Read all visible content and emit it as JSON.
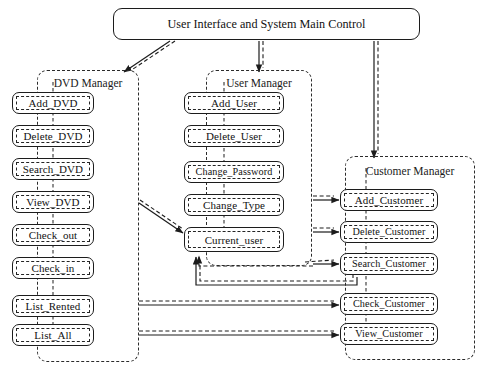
{
  "diagram": {
    "title": "User Interface and System Main Control",
    "root": {
      "label": "User Interface and System Main Control",
      "x": 113,
      "y": 8,
      "w": 307,
      "h": 32
    },
    "packages": [
      {
        "id": "dvd-manager",
        "label": "DVD Manager",
        "x": 37,
        "y": 70,
        "w": 102,
        "h": 292,
        "title_top": 6,
        "nodes": [
          {
            "id": "add-dvd",
            "label": "Add_DVD",
            "x": 12,
            "y": 92,
            "w": 82,
            "h": 22
          },
          {
            "id": "delete-dvd",
            "label": "Delete_DVD",
            "x": 12,
            "y": 125,
            "w": 82,
            "h": 22
          },
          {
            "id": "search-dvd",
            "label": "Search_DVD",
            "x": 12,
            "y": 158,
            "w": 82,
            "h": 22
          },
          {
            "id": "view-dvd",
            "label": "View_DVD",
            "x": 12,
            "y": 191,
            "w": 82,
            "h": 22
          },
          {
            "id": "check-out",
            "label": "Check_out",
            "x": 12,
            "y": 224,
            "w": 82,
            "h": 22
          },
          {
            "id": "check-in",
            "label": "Check_in",
            "x": 12,
            "y": 257,
            "w": 82,
            "h": 22
          },
          {
            "id": "list-rented",
            "label": "List_Rented",
            "x": 12,
            "y": 295,
            "w": 82,
            "h": 22
          },
          {
            "id": "list-all",
            "label": "List_All",
            "x": 12,
            "y": 324,
            "w": 82,
            "h": 22
          }
        ]
      },
      {
        "id": "user-manager",
        "label": "User Manager",
        "x": 206,
        "y": 70,
        "w": 106,
        "h": 196,
        "title_top": 6,
        "nodes": [
          {
            "id": "add-user",
            "label": "Add_User",
            "x": 184,
            "y": 92,
            "w": 100,
            "h": 22
          },
          {
            "id": "delete-user",
            "label": "Delete_User",
            "x": 184,
            "y": 125,
            "w": 100,
            "h": 22
          },
          {
            "id": "change-password",
            "label": "Change_Password",
            "x": 184,
            "y": 161,
            "w": 100,
            "h": 22,
            "tight": true
          },
          {
            "id": "change-type",
            "label": "Change_Type",
            "x": 184,
            "y": 194,
            "w": 100,
            "h": 22
          },
          {
            "id": "current-user",
            "label": "Current_user",
            "x": 184,
            "y": 227,
            "w": 100,
            "h": 25
          }
        ]
      },
      {
        "id": "customer-manager",
        "label": "Customer Manager",
        "x": 345,
        "y": 156,
        "w": 130,
        "h": 204,
        "title_top": 8,
        "nodes": [
          {
            "id": "add-customer",
            "label": "Add_Customer",
            "x": 340,
            "y": 189,
            "w": 98,
            "h": 22
          },
          {
            "id": "delete-customer",
            "label": "Delete_Customer",
            "x": 340,
            "y": 221,
            "w": 98,
            "h": 22,
            "tight": true
          },
          {
            "id": "search-customer",
            "label": "Search_Customer",
            "x": 340,
            "y": 253,
            "w": 98,
            "h": 22,
            "tight": true
          },
          {
            "id": "check-customer",
            "label": "Check_Customer",
            "x": 340,
            "y": 293,
            "w": 98,
            "h": 22,
            "tight": true
          },
          {
            "id": "view-customer",
            "label": "View_Customer",
            "x": 340,
            "y": 323,
            "w": 98,
            "h": 22,
            "tight": true
          }
        ]
      }
    ],
    "colors": {
      "stroke": "#1c1c1c",
      "background": "#ffffff",
      "text": "#111111"
    }
  }
}
